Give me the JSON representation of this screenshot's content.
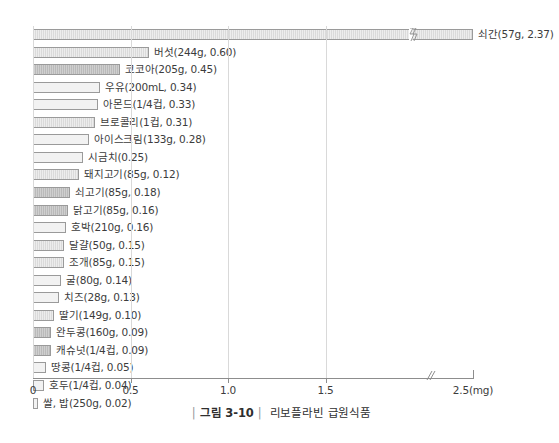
{
  "caption": {
    "bar": "|",
    "figure_number": "그림 3-10",
    "title": "리보플라빈 급원식품"
  },
  "axis": {
    "unit": "(mg)",
    "break_marker": "//",
    "ticks": [
      {
        "label": "0",
        "value": 0.0
      },
      {
        "label": "0.5",
        "value": 0.5
      },
      {
        "label": "1.0",
        "value": 1.0
      },
      {
        "label": "1.5",
        "value": 1.5
      },
      {
        "label": "2.5(mg)",
        "value": 2.5
      }
    ]
  },
  "chart_data": {
    "type": "bar",
    "orientation": "horizontal",
    "title": "리보플라빈 급원식품",
    "xlabel": "(mg)",
    "ylabel": "",
    "xlim": [
      0,
      2.5
    ],
    "grid": false,
    "axis_break": {
      "after": 1.95,
      "before": 2.3
    },
    "categories": [
      "쇠간",
      "버섯",
      "코코아",
      "우유",
      "아몬드",
      "브로콜리",
      "아이스크림",
      "시금치",
      "돼지고기",
      "쇠고기",
      "닭고기",
      "호박",
      "달걀",
      "조개",
      "굴",
      "치즈",
      "딸기",
      "완두콩",
      "캐슈넛",
      "땅콩",
      "호두",
      "쌀, 밥"
    ],
    "values": [
      2.37,
      0.6,
      0.45,
      0.34,
      0.33,
      0.31,
      0.28,
      0.25,
      0.12,
      0.18,
      0.16,
      0.16,
      0.15,
      0.15,
      0.14,
      0.13,
      0.1,
      0.09,
      0.09,
      0.05,
      0.04,
      0.02
    ],
    "portions": [
      "57g",
      "244g",
      "205g",
      "200mL",
      "1/4컵",
      "1컵",
      "133g",
      "",
      "85g",
      "85g",
      "85g",
      "210g",
      "50g",
      "85g",
      "80g",
      "28g",
      "149g",
      "160g",
      "1/4컵",
      "1/4컵",
      "1/4컵",
      "250g"
    ],
    "labels": [
      "쇠간(57g, 2.37)",
      "버섯(244g, 0.60)",
      "코코아(205g, 0.45)",
      "우유(200mL, 0.34)",
      "아몬드(1/4컵, 0.33)",
      "브로콜리(1컵, 0.31)",
      "아이스크림(133g, 0.28)",
      "시금치(0.25)",
      "돼지고기(85g, 0.12)",
      "쇠고기(85g, 0.18)",
      "닭고기(85g, 0.16)",
      "호박(210g, 0.16)",
      "달걀(50g, 0.15)",
      "조개(85g, 0.15)",
      "굴(80g, 0.14)",
      "치즈(28g, 0.13)",
      "딸기(149g, 0.10)",
      "완두콩(160g, 0.09)",
      "캐슈넛(1/4컵, 0.09)",
      "땅콩(1/4컵, 0.05)",
      "호두(1/4컵, 0.04)",
      "쌀, 밥(250g, 0.02)"
    ],
    "bar_px_widths": [
      440,
      116,
      87,
      67,
      65,
      62,
      56,
      50,
      46,
      37,
      35,
      33,
      31,
      31,
      28,
      26,
      21,
      18,
      18,
      13,
      11,
      5
    ],
    "bar_styles": [
      "hatch",
      "hatch",
      "dark",
      "plain",
      "plain",
      "hatch",
      "plain",
      "plain",
      "hatch",
      "dark",
      "dark",
      "plain",
      "hatch",
      "hatch",
      "plain",
      "plain",
      "hatch",
      "dark",
      "dark",
      "plain",
      "plain",
      "plain"
    ],
    "colors": {
      "bar_light": "#ededed",
      "bar_mid": "#e0e0e0",
      "bar_dark": "#cfcfcf",
      "bar_border": "#9a9a9a",
      "axis": "#8d8d8d",
      "text": "#3c3c3c"
    }
  }
}
